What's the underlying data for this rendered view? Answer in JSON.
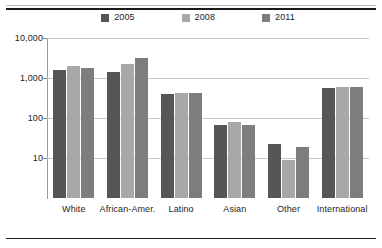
{
  "chart_data": {
    "type": "bar",
    "title": "",
    "xlabel": "",
    "ylabel": "",
    "yscale": "log",
    "ylim": [
      5,
      10000
    ],
    "grid": true,
    "legend_position": "top-center",
    "ytick_labels": [
      "10,000",
      "1,000",
      "100",
      "10"
    ],
    "ytick_values": [
      10000,
      1000,
      100,
      10
    ],
    "categories": [
      "White",
      "African-Amer.",
      "Latino",
      "Asian",
      "Other",
      "International"
    ],
    "series": [
      {
        "name": "2005",
        "color": "#565659",
        "values": [
          1550,
          1450,
          410,
          68,
          23,
          560
        ]
      },
      {
        "name": "2008",
        "color": "#a8a8a8",
        "values": [
          1950,
          2200,
          430,
          80,
          9,
          610
        ]
      },
      {
        "name": "2011",
        "color": "#7d7d80",
        "values": [
          1800,
          3200,
          420,
          68,
          19,
          580
        ]
      }
    ]
  },
  "legend": {
    "items": [
      {
        "label": "2005",
        "color": "#565659"
      },
      {
        "label": "2008",
        "color": "#a8a8a8"
      },
      {
        "label": "2011",
        "color": "#7d7d80"
      }
    ]
  },
  "axes": {
    "y_ticks": [
      {
        "label": "10,000",
        "value": 10000
      },
      {
        "label": "1,000",
        "value": 1000
      },
      {
        "label": "100",
        "value": 100
      },
      {
        "label": "10",
        "value": 10
      }
    ],
    "x_categories": [
      {
        "label": "White"
      },
      {
        "label": "African-Amer."
      },
      {
        "label": "Latino"
      },
      {
        "label": "Asian"
      },
      {
        "label": "Other"
      },
      {
        "label": "International"
      }
    ]
  }
}
